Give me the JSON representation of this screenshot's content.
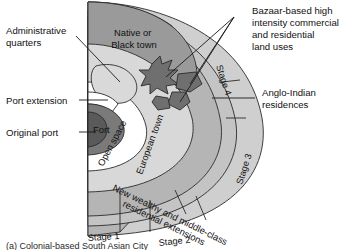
{
  "figure": {
    "caption_partial": "(a) Colonial-based South Asian City",
    "background_color": "#ffffff"
  },
  "palette": {
    "native_black_town": "#9a9a9a",
    "stage1_outer_wedge": "#b5b5b5",
    "stage2_band": "#b5b5b5",
    "stage3_band": "#c4c4c4",
    "stage4_band": "#cfcfcf",
    "european_town": "#d8d8d8",
    "open_space": "#ffffff",
    "fort": "#7a7a7a",
    "original_port": "#5a5a5a",
    "port_extension": "#ffffff",
    "administrative_quarters": "#d9d9d9",
    "bazaar": "#6f6f6f",
    "outline": "#2b2b2b",
    "text": "#111111"
  },
  "callouts": [
    {
      "id": "administrative-quarters",
      "lines": [
        "Administrative",
        "quarters"
      ],
      "side": "left"
    },
    {
      "id": "port-extension",
      "lines": [
        "Port extension"
      ],
      "side": "left"
    },
    {
      "id": "original-port",
      "lines": [
        "Original port"
      ],
      "side": "left"
    },
    {
      "id": "bazaar-based-land-uses",
      "lines": [
        "Bazaar-based high",
        "intensity commercial",
        "and residential",
        "land uses"
      ],
      "side": "right"
    },
    {
      "id": "anglo-indian-residences",
      "lines": [
        "Anglo-Indian",
        "residences"
      ],
      "side": "right"
    }
  ],
  "zones": [
    {
      "id": "native-or-black-town",
      "lines": [
        "Native or",
        "Black town"
      ]
    },
    {
      "id": "fort",
      "lines": [
        "Fort"
      ]
    },
    {
      "id": "open-space",
      "lines": [
        "Open space"
      ]
    },
    {
      "id": "european-town",
      "lines": [
        "European town"
      ]
    },
    {
      "id": "new-wealthy-extensions",
      "lines": [
        "New wealthy and middle-class",
        "residential extensions"
      ]
    }
  ],
  "stages": [
    {
      "id": "stage-1",
      "label": "Stage 1"
    },
    {
      "id": "stage-2",
      "label": "Stage 2"
    },
    {
      "id": "stage-3",
      "label": "Stage 3"
    },
    {
      "id": "stage-4",
      "label": "Stage 4"
    }
  ]
}
